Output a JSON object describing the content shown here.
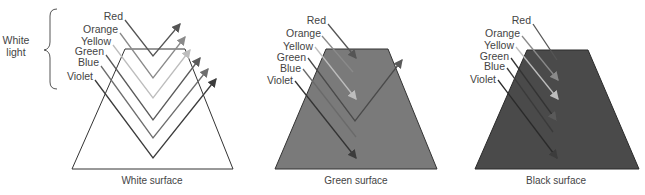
{
  "side_label": {
    "line1": "White",
    "line2": "light"
  },
  "panels": [
    {
      "caption": "White surface",
      "fill": "#ffffff",
      "labels": [
        "Red",
        "Orange",
        "Yellow",
        "Green",
        "Blue",
        "Violet"
      ],
      "behavior": "all colors reflected"
    },
    {
      "caption": "Green surface",
      "fill": "#7a7a7a",
      "labels": [
        "Red",
        "Orange",
        "Yellow",
        "Green",
        "Blue",
        "Violet"
      ],
      "behavior": "only green reflected"
    },
    {
      "caption": "Black surface",
      "fill": "#4a4a4a",
      "labels": [
        "Red",
        "Orange",
        "Yellow",
        "Green",
        "Blue",
        "Violet"
      ],
      "behavior": "all colors absorbed"
    }
  ],
  "colors": {
    "red": "#555555",
    "orange": "#8a8a8a",
    "yellow": "#bdbdbd",
    "green": "#5a5a5a",
    "blue": "#6e6e6e",
    "violet": "#3c3c3c",
    "outline": "#333333"
  }
}
